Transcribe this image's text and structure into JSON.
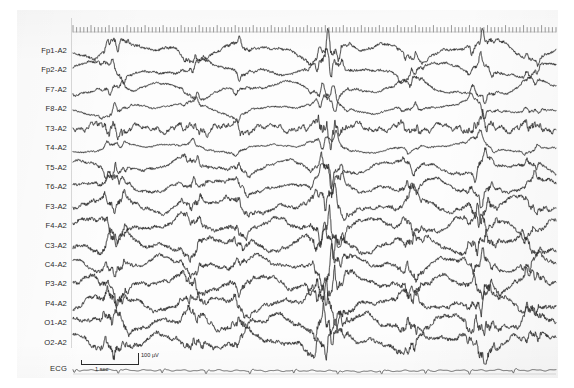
{
  "recording": {
    "title": "EEG recording",
    "montage": "referential to A2",
    "channel_count": 17,
    "duration_seconds": 10,
    "background_color": "#fdfdfd",
    "trace_color": "#1f1f1f"
  },
  "channels": [
    {
      "label": "Fp1-A2",
      "type": "eeg"
    },
    {
      "label": "Fp2-A2",
      "type": "eeg"
    },
    {
      "label": "F7-A2",
      "type": "eeg"
    },
    {
      "label": "F8-A2",
      "type": "eeg"
    },
    {
      "label": "T3-A2",
      "type": "eeg"
    },
    {
      "label": "T4-A2",
      "type": "eeg"
    },
    {
      "label": "T5-A2",
      "type": "eeg"
    },
    {
      "label": "T6-A2",
      "type": "eeg"
    },
    {
      "label": "F3-A2",
      "type": "eeg"
    },
    {
      "label": "F4-A2",
      "type": "eeg"
    },
    {
      "label": "C3-A2",
      "type": "eeg"
    },
    {
      "label": "C4-A2",
      "type": "eeg"
    },
    {
      "label": "P3-A2",
      "type": "eeg"
    },
    {
      "label": "P4-A2",
      "type": "eeg"
    },
    {
      "label": "O1-A2",
      "type": "eeg"
    },
    {
      "label": "O2-A2",
      "type": "eeg"
    },
    {
      "label": "ECG",
      "type": "ecg"
    }
  ],
  "calibration": {
    "amplitude_label": "100 µV",
    "time_label": "1 sec"
  },
  "timescale": {
    "tick_count": 135,
    "description": "time tick marks along top of trace panel"
  },
  "chart_data": {
    "type": "line",
    "xlabel": "time",
    "ylabel": "channel",
    "grid": false,
    "legend": "none",
    "x_unit": "seconds",
    "y_unit": "microvolts",
    "series": [
      {
        "name": "Fp1-A2",
        "amplitude": 13,
        "frequency": 5.2,
        "roughness": 0.55,
        "seed": 11
      },
      {
        "name": "Fp2-A2",
        "amplitude": 12,
        "frequency": 5.0,
        "roughness": 0.5,
        "seed": 23
      },
      {
        "name": "F7-A2",
        "amplitude": 11,
        "frequency": 4.6,
        "roughness": 0.48,
        "seed": 37
      },
      {
        "name": "F8-A2",
        "amplitude": 10,
        "frequency": 4.2,
        "roughness": 0.44,
        "seed": 41
      },
      {
        "name": "T3-A2",
        "amplitude": 7,
        "frequency": 14.0,
        "roughness": 1.25,
        "seed": 53
      },
      {
        "name": "T4-A2",
        "amplitude": 9,
        "frequency": 4.0,
        "roughness": 0.42,
        "seed": 67
      },
      {
        "name": "T5-A2",
        "amplitude": 11,
        "frequency": 5.6,
        "roughness": 0.6,
        "seed": 71
      },
      {
        "name": "T6-A2",
        "amplitude": 12,
        "frequency": 5.4,
        "roughness": 0.62,
        "seed": 83
      },
      {
        "name": "F3-A2",
        "amplitude": 13,
        "frequency": 6.0,
        "roughness": 0.7,
        "seed": 97
      },
      {
        "name": "F4-A2",
        "amplitude": 13,
        "frequency": 6.2,
        "roughness": 0.72,
        "seed": 101
      },
      {
        "name": "C3-A2",
        "amplitude": 13,
        "frequency": 6.4,
        "roughness": 0.74,
        "seed": 113
      },
      {
        "name": "C4-A2",
        "amplitude": 12,
        "frequency": 6.1,
        "roughness": 0.7,
        "seed": 127
      },
      {
        "name": "P3-A2",
        "amplitude": 13,
        "frequency": 6.6,
        "roughness": 0.76,
        "seed": 139
      },
      {
        "name": "P4-A2",
        "amplitude": 13,
        "frequency": 6.3,
        "roughness": 0.74,
        "seed": 149
      },
      {
        "name": "O1-A2",
        "amplitude": 13,
        "frequency": 6.8,
        "roughness": 0.8,
        "seed": 163
      },
      {
        "name": "O2-A2",
        "amplitude": 13,
        "frequency": 6.5,
        "roughness": 0.78,
        "seed": 179
      },
      {
        "name": "ECG",
        "amplitude": 2,
        "frequency": 1.2,
        "roughness": 0.3,
        "seed": 191
      }
    ],
    "bursts": [
      {
        "x_fraction": 0.085,
        "width": 0.03,
        "gain": 2.0
      },
      {
        "x_fraction": 0.25,
        "width": 0.026,
        "gain": 1.8
      },
      {
        "x_fraction": 0.345,
        "width": 0.022,
        "gain": 1.7
      },
      {
        "x_fraction": 0.53,
        "width": 0.034,
        "gain": 2.6
      },
      {
        "x_fraction": 0.7,
        "width": 0.026,
        "gain": 1.9
      },
      {
        "x_fraction": 0.845,
        "width": 0.03,
        "gain": 2.2
      },
      {
        "x_fraction": 0.95,
        "width": 0.024,
        "gain": 1.8
      }
    ]
  }
}
